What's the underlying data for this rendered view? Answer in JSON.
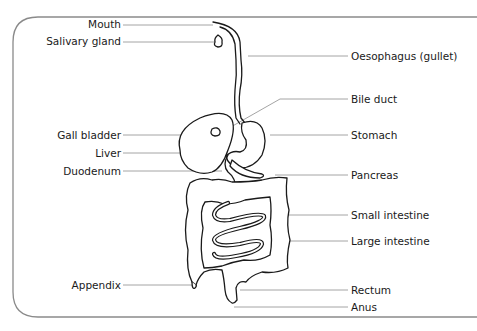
{
  "diagram": {
    "labels_left": [
      {
        "id": "mouth",
        "text": "Mouth"
      },
      {
        "id": "salivary-gland",
        "text": "Salivary gland"
      },
      {
        "id": "gall-bladder",
        "text": "Gall bladder"
      },
      {
        "id": "liver",
        "text": "Liver"
      },
      {
        "id": "duodenum",
        "text": "Duodenum"
      },
      {
        "id": "appendix",
        "text": "Appendix"
      }
    ],
    "labels_right": [
      {
        "id": "oesophagus",
        "text": "Oesophagus (gullet)"
      },
      {
        "id": "bile-duct",
        "text": "Bile duct"
      },
      {
        "id": "stomach",
        "text": "Stomach"
      },
      {
        "id": "pancreas",
        "text": "Pancreas"
      },
      {
        "id": "small-intestine",
        "text": "Small intestine"
      },
      {
        "id": "large-intestine",
        "text": "Large intestine"
      },
      {
        "id": "rectum",
        "text": "Rectum"
      },
      {
        "id": "anus",
        "text": "Anus"
      }
    ],
    "colors": {
      "outline": "#1a1a1a",
      "leader_line": "#9a9a9a",
      "frame": "#8a8a8a",
      "background": "#ffffff"
    }
  }
}
